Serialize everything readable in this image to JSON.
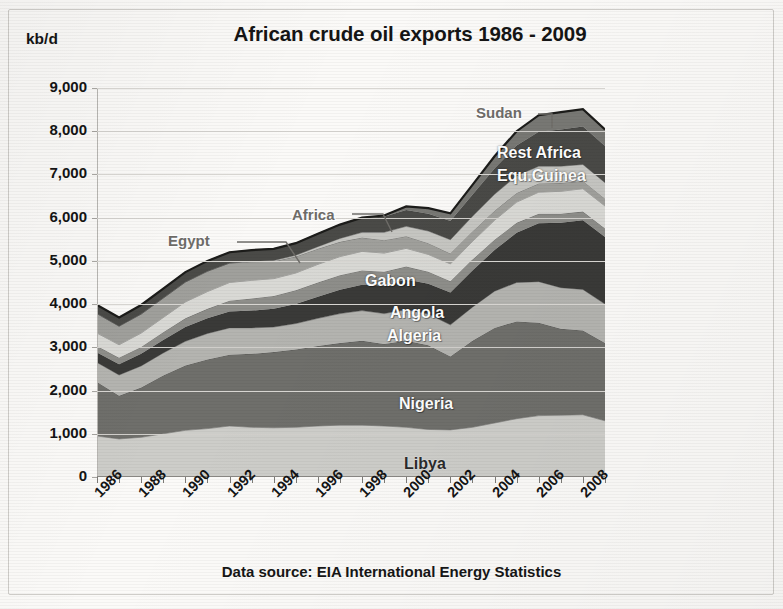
{
  "chart_title": "African crude oil exports 1986 - 2009",
  "y_unit": "kb/d",
  "source_note": "Data source: EIA International Energy Statistics",
  "y_ticks": [
    "9,000",
    "8,000",
    "7,000",
    "6,000",
    "5,000",
    "4,000",
    "3,000",
    "2,000",
    "1,000",
    "0"
  ],
  "x_ticks": [
    "1986",
    "1988",
    "1990",
    "1992",
    "1994",
    "1996",
    "1998",
    "2000",
    "2002",
    "2004",
    "2006",
    "2008"
  ],
  "series_labels": [
    {
      "name": "Sudan",
      "style": "callout"
    },
    {
      "name": "Rest Africa",
      "style": "light"
    },
    {
      "name": "Equ.Guinea",
      "style": "light"
    },
    {
      "name": "Egypt",
      "style": "callout"
    },
    {
      "name": "Africa",
      "style": "callout"
    },
    {
      "name": "Gabon",
      "style": "light"
    },
    {
      "name": "Angola",
      "style": "light"
    },
    {
      "name": "Algeria",
      "style": "light"
    },
    {
      "name": "Nigeria",
      "style": "light"
    },
    {
      "name": "Libya",
      "style": "dark"
    }
  ],
  "colors": {
    "libya": "#cdcdc9",
    "nigeria": "#6f6f6b",
    "algeria": "#b4b4b0",
    "angola": "#3a3a38",
    "gabon": "#8e8e8a",
    "africa": "#d9d9d5",
    "egypt": "#a0a09c",
    "equ_guinea": "#c6c6c2",
    "rest_africa": "#4a4a47",
    "sudan": "#787874",
    "outline": "#1c1c1a",
    "gridline": "#d8d6d2",
    "text": "#141414"
  },
  "chart_data": {
    "type": "area",
    "stacked": true,
    "title": "African crude oil exports 1986 - 2009",
    "xlabel": "",
    "ylabel": "kb/d",
    "ylim": [
      0,
      9000
    ],
    "xlim": [
      1986,
      2009
    ],
    "grid": true,
    "legend": "in-chart labels",
    "x": [
      1986,
      1987,
      1988,
      1989,
      1990,
      1991,
      1992,
      1993,
      1994,
      1995,
      1996,
      1997,
      1998,
      1999,
      2000,
      2001,
      2002,
      2003,
      2004,
      2005,
      2006,
      2007,
      2008,
      2009
    ],
    "series": [
      {
        "name": "Libya",
        "values": [
          950,
          880,
          920,
          1000,
          1080,
          1120,
          1180,
          1150,
          1140,
          1150,
          1180,
          1200,
          1200,
          1180,
          1150,
          1100,
          1090,
          1150,
          1250,
          1350,
          1420,
          1430,
          1440,
          1300
        ]
      },
      {
        "name": "Nigeria",
        "values": [
          1250,
          1000,
          1150,
          1350,
          1500,
          1600,
          1650,
          1700,
          1750,
          1800,
          1850,
          1900,
          1950,
          1900,
          2000,
          1950,
          1700,
          2000,
          2200,
          2250,
          2150,
          2000,
          1950,
          1800
        ]
      },
      {
        "name": "Algeria",
        "values": [
          450,
          480,
          500,
          520,
          560,
          600,
          620,
          600,
          580,
          600,
          640,
          680,
          700,
          700,
          720,
          720,
          730,
          780,
          850,
          900,
          950,
          950,
          950,
          900
        ]
      },
      {
        "name": "Angola",
        "values": [
          230,
          250,
          280,
          300,
          330,
          350,
          380,
          400,
          420,
          450,
          500,
          550,
          600,
          650,
          700,
          700,
          750,
          850,
          950,
          1150,
          1350,
          1500,
          1600,
          1550
        ]
      },
      {
        "name": "Gabon",
        "values": [
          150,
          150,
          160,
          180,
          200,
          220,
          250,
          280,
          300,
          320,
          330,
          340,
          330,
          320,
          300,
          280,
          260,
          250,
          240,
          230,
          220,
          210,
          200,
          200
        ]
      },
      {
        "name": "Africa",
        "values": [
          300,
          300,
          320,
          340,
          380,
          400,
          420,
          420,
          400,
          400,
          420,
          430,
          440,
          430,
          420,
          400,
          400,
          420,
          450,
          480,
          500,
          520,
          530,
          520
        ]
      },
      {
        "name": "Egypt",
        "values": [
          450,
          430,
          440,
          450,
          460,
          470,
          450,
          430,
          400,
          380,
          360,
          340,
          320,
          300,
          280,
          260,
          240,
          230,
          220,
          210,
          200,
          190,
          180,
          170
        ]
      },
      {
        "name": "Equ.Guinea",
        "values": [
          0,
          0,
          0,
          0,
          0,
          0,
          0,
          10,
          20,
          30,
          50,
          80,
          120,
          180,
          230,
          280,
          320,
          350,
          380,
          400,
          400,
          390,
          380,
          370
        ]
      },
      {
        "name": "Rest Africa",
        "values": [
          200,
          200,
          210,
          220,
          230,
          240,
          250,
          260,
          270,
          280,
          300,
          320,
          340,
          360,
          380,
          400,
          430,
          500,
          600,
          700,
          800,
          850,
          880,
          850
        ]
      },
      {
        "name": "Sudan",
        "values": [
          0,
          0,
          0,
          0,
          0,
          0,
          0,
          0,
          0,
          0,
          0,
          0,
          0,
          30,
          80,
          130,
          180,
          230,
          280,
          330,
          380,
          400,
          400,
          380
        ]
      }
    ]
  }
}
